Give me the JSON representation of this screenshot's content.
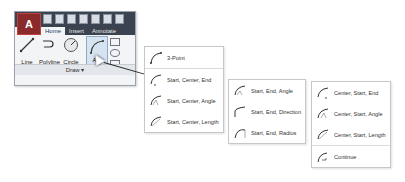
{
  "ribbon": {
    "app_button": "A",
    "tabs": [
      {
        "label": "Home",
        "active": true
      },
      {
        "label": "Insert",
        "active": false
      },
      {
        "label": "Annotate",
        "active": false
      }
    ],
    "tools": [
      {
        "label": "Line",
        "icon": "line-icon"
      },
      {
        "label": "Polyline",
        "icon": "polyline-icon"
      },
      {
        "label": "Circle",
        "icon": "circle-icon"
      },
      {
        "label": "Arc",
        "icon": "arc-icon"
      }
    ],
    "panel_label": "Draw ▾"
  },
  "menus": {
    "group1": [
      {
        "label": "3-Point",
        "icon": "arc-3point-icon"
      },
      {
        "label": "Start, Center, End",
        "icon": "arc-sce-icon"
      },
      {
        "label": "Start, Center, Angle",
        "icon": "arc-sca-icon"
      },
      {
        "label": "Start, Center, Length",
        "icon": "arc-scl-icon"
      }
    ],
    "group2": [
      {
        "label": "Start, End, Angle",
        "icon": "arc-sea-icon"
      },
      {
        "label": "Start, End, Direction",
        "icon": "arc-sed-icon"
      },
      {
        "label": "Start, End, Radius",
        "icon": "arc-ser-icon"
      }
    ],
    "group3": [
      {
        "label": "Center, Start, End",
        "icon": "arc-cse-icon"
      },
      {
        "label": "Center, Start, Angle",
        "icon": "arc-csa-icon"
      },
      {
        "label": "Center, Start, Length",
        "icon": "arc-csl-icon"
      },
      {
        "label": "Continue",
        "icon": "arc-continue-icon"
      }
    ]
  }
}
